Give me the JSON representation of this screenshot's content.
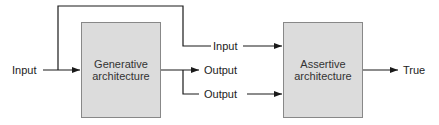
{
  "diagram": {
    "type": "block-diagram",
    "nodes": {
      "generative": {
        "line1": "Generative",
        "line2": "architecture"
      },
      "assertive": {
        "line1": "Assertive",
        "line2": "architecture"
      }
    },
    "labels": {
      "input_left": "Input",
      "input_top": "Input",
      "output_mid": "Output",
      "output_low": "Output",
      "true_out": "True"
    },
    "edges": [
      {
        "from": "Input",
        "to": "Generative architecture"
      },
      {
        "from": "Input",
        "to": "Assertive architecture",
        "label": "Input"
      },
      {
        "from": "Generative architecture",
        "to": "Output",
        "label": "Output"
      },
      {
        "from": "Generative architecture",
        "to": "Assertive architecture",
        "label": "Output"
      },
      {
        "from": "Assertive architecture",
        "to": "True",
        "label": "True"
      }
    ],
    "colors": {
      "box_fill": "#dcdcdc",
      "box_border": "#888888",
      "line": "#1a1a1a"
    }
  }
}
